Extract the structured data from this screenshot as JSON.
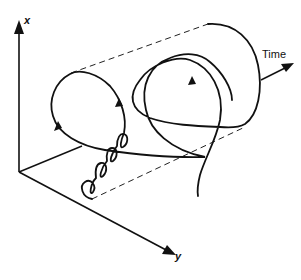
{
  "diagram": {
    "type": "3d-helix-trajectory",
    "axes": {
      "x": {
        "label": "x"
      },
      "y": {
        "label": "y"
      },
      "time": {
        "label": "Time"
      }
    },
    "colors": {
      "stroke": "#111111",
      "background": "#ffffff"
    },
    "elements": [
      "vertical x axis with arrow",
      "diagonal y axis with arrow",
      "horizontal-ish baseline from origin",
      "expanding spiral trajectory: small tight loops growing into large loops",
      "dashed envelope lines forming a cone/cylinder",
      "direction arrowheads on trajectory",
      "Time arrow pointing right"
    ]
  }
}
